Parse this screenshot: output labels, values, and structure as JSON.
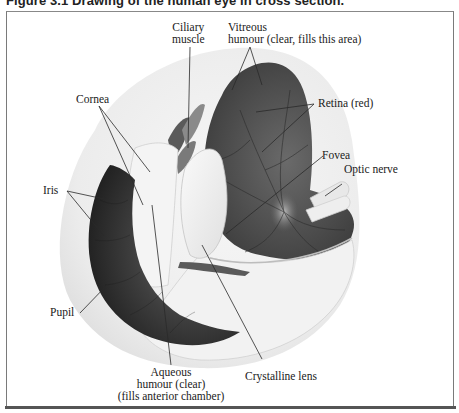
{
  "figure": {
    "title": "Figure 3.1   Drawing of the human eye in cross section."
  },
  "labels": {
    "ciliary_muscle": [
      "Ciliary",
      "muscle"
    ],
    "vitreous_humour": [
      "Vitreous",
      "humour (clear, fills this area)"
    ],
    "retina": "Retina (red)",
    "cornea": "Cornea",
    "fovea": "Fovea",
    "optic_nerve": "Optic nerve",
    "iris": "Iris",
    "pupil": "Pupil",
    "aqueous_humour": [
      "Aqueous",
      "humour (clear)",
      "(fills anterior chamber)"
    ],
    "crystalline_lens": "Crystalline lens"
  },
  "colors": {
    "frame": "#7a7a7a",
    "leader_line": "#2a2a2a",
    "retina_dark": "#4a4a4a",
    "sclera": "#efefef",
    "iris_dark": "#2e2e2e"
  }
}
